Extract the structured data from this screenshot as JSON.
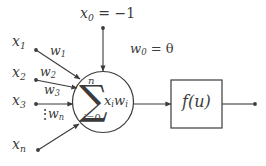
{
  "diagram": {
    "colors": {
      "stroke": "#3b3b3b",
      "text": "#3b3b3b",
      "background": "#ffffff"
    },
    "bias": {
      "input_label_base": "x",
      "input_label_sub": "0",
      "input_label_rest": " = −1",
      "weight_label_base": "w",
      "weight_label_sub": "0",
      "weight_label_rest": " = θ"
    },
    "inputs": [
      {
        "base": "x",
        "sub": "1",
        "weight_base": "w",
        "weight_sub": "1"
      },
      {
        "base": "x",
        "sub": "2",
        "weight_base": "w",
        "weight_sub": "2"
      },
      {
        "base": "x",
        "sub": "3",
        "weight_base": "w",
        "weight_sub": "3"
      },
      {
        "base": "x",
        "sub": "n",
        "weight_base": "w",
        "weight_sub": "n"
      }
    ],
    "ellipsis": "⋮",
    "summation": {
      "symbol": "∑",
      "upper_limit": "n",
      "lower_limit_base": "i",
      "lower_limit_rest": "=0",
      "term_x": "x",
      "term_x_sub": "i",
      "term_w": "w",
      "term_w_sub": "i"
    },
    "activation": {
      "function_base": "f",
      "function_arg": "(u)"
    }
  }
}
